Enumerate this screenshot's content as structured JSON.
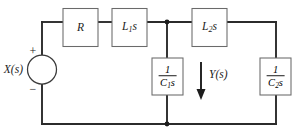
{
  "diagram": {
    "type": "circuit-schematic",
    "colors": {
      "wire": "#2b2b2b",
      "box_stroke": "#6a6a6a",
      "background": "#ffffff",
      "text": "#1c1c1c"
    }
  },
  "source": {
    "label": "X(s)",
    "plus_sign": "+",
    "minus_sign": "−"
  },
  "components": {
    "resistor": {
      "label": "R"
    },
    "inductor1": {
      "label_base": "L",
      "label_sub": "1",
      "label_suffix": "s"
    },
    "inductor2": {
      "label_base": "L",
      "label_sub": "2",
      "label_suffix": "s"
    },
    "capacitor1": {
      "numerator": "1",
      "den_base": "C",
      "den_sub": "1",
      "den_suffix": "s"
    },
    "capacitor2": {
      "numerator": "1",
      "den_base": "C",
      "den_sub": "2",
      "den_suffix": "s"
    }
  },
  "output": {
    "label": "Y(s)",
    "arrow_direction": "down"
  }
}
